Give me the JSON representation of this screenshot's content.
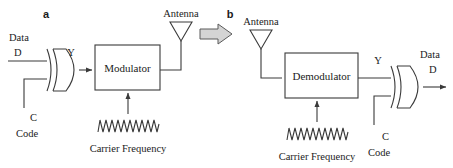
{
  "figure": {
    "type": "block-diagram",
    "stroke_color": "#3a3a3a",
    "fill_color": "#ffffff",
    "arrow_fill": "#d4d4d4",
    "background": "#ffffff"
  },
  "panels": [
    {
      "letter": "a",
      "name": "transmitter",
      "labels": {
        "data_in_top": "Data",
        "data_in_bottom": "D",
        "gate_output": "Y",
        "code_in_top": "C",
        "code_in_bottom": "Code",
        "block": "Modulator",
        "carrier": "Carrier Frequency",
        "antenna": "Antenna"
      },
      "gate": {
        "name": "xor-gate",
        "inputs": [
          "D",
          "C"
        ],
        "output": "Y"
      }
    },
    {
      "letter": "b",
      "name": "receiver",
      "labels": {
        "antenna": "Antenna",
        "block": "Demodulator",
        "carrier": "Carrier Frequency",
        "gate_input": "Y",
        "code_in_top": "C",
        "code_in_bottom": "Code",
        "data_out_top": "Data",
        "data_out_bottom": "D"
      },
      "gate": {
        "name": "xor-gate",
        "inputs": [
          "Y",
          "C"
        ],
        "output": "D"
      }
    }
  ],
  "transition_arrow": {
    "name": "right-arrow",
    "glyph": "right"
  }
}
